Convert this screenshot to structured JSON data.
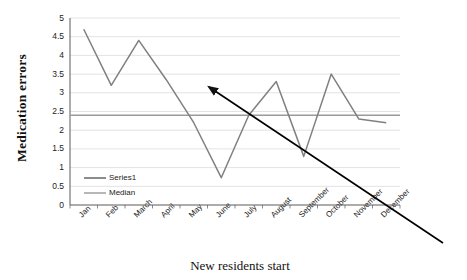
{
  "chart_data": {
    "type": "line",
    "title": "",
    "xlabel": "New residents start",
    "ylabel": "Medication errors",
    "categories": [
      "Jan",
      "Feb",
      "March",
      "April",
      "May",
      "June",
      "July",
      "August",
      "September",
      "October",
      "November",
      "December"
    ],
    "series": [
      {
        "name": "Series1",
        "values": [
          4.7,
          3.2,
          4.4,
          3.35,
          2.2,
          0.73,
          2.4,
          3.3,
          1.3,
          3.5,
          2.3,
          2.2
        ],
        "color": "#808080"
      },
      {
        "name": "Median",
        "values": [
          2.4,
          2.4,
          2.4,
          2.4,
          2.4,
          2.4,
          2.4,
          2.4,
          2.4,
          2.4,
          2.4,
          2.4
        ],
        "color": "#9a9a9a"
      }
    ],
    "ylim": [
      0,
      5
    ],
    "ytick_labels": [
      "0",
      "0.5",
      "1",
      "1.5",
      "2",
      "2.5",
      "3",
      "3.5",
      "4",
      "4.5",
      "5"
    ],
    "ytick_values": [
      0,
      0.5,
      1,
      1.5,
      2,
      2.5,
      3,
      3.5,
      4,
      4.5,
      5
    ],
    "grid": true,
    "legend_position": "inside-lower-left",
    "annotations": [
      {
        "name": "downward-trend-arrow",
        "type": "arrow",
        "color": "#000000",
        "from_x_px": 443,
        "from_y_px": 243,
        "to_x_px": 209,
        "to_y_px": 87
      }
    ]
  },
  "legend": {
    "entries": [
      {
        "label": "Series1",
        "color": "#6e6e6e"
      },
      {
        "label": "Median",
        "color": "#a6a6a6"
      }
    ]
  },
  "colors": {
    "axis": "#5a5a5a",
    "grid": "#e3e3e3",
    "background": "#ffffff",
    "arrow": "#111111"
  }
}
